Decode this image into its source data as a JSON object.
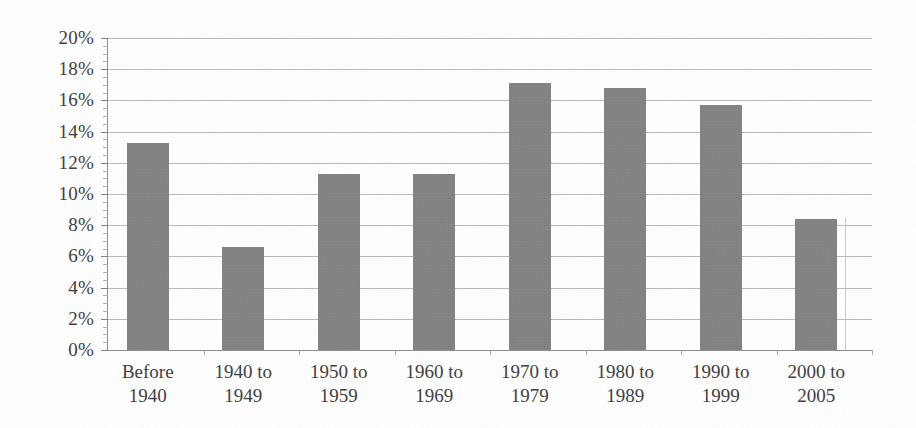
{
  "chart_data": {
    "type": "bar",
    "title": "",
    "subtitle": "",
    "xlabel": "",
    "ylabel": "",
    "categories": [
      "Before 1940",
      "1940 to 1949",
      "1950 to 1959",
      "1960 to 1969",
      "1970 to 1979",
      "1980 to 1989",
      "1990 to 1999",
      "2000 to 2005"
    ],
    "category_lines": [
      [
        "Before",
        "1940"
      ],
      [
        "1940 to",
        "1949"
      ],
      [
        "1950 to",
        "1959"
      ],
      [
        "1960 to",
        "1969"
      ],
      [
        "1970 to",
        "1979"
      ],
      [
        "1980 to",
        "1989"
      ],
      [
        "1990 to",
        "1999"
      ],
      [
        "2000 to",
        "2005"
      ]
    ],
    "values": [
      13.3,
      6.6,
      11.3,
      11.3,
      17.1,
      16.8,
      15.7,
      8.4
    ],
    "value_labels": [
      "13.3%",
      "6.6%",
      "11.3%",
      "11.3%",
      "17.1%",
      "16.8%",
      "15.7%",
      "8.4%"
    ],
    "ylim": [
      0,
      20
    ],
    "ytick_values": [
      0,
      2,
      4,
      6,
      8,
      10,
      12,
      14,
      16,
      18,
      20
    ],
    "ytick_labels": [
      "0%",
      "2%",
      "4%",
      "6%",
      "8%",
      "10%",
      "12%",
      "14%",
      "16%",
      "18%",
      "20%"
    ],
    "y_minor_tick_step": 0.5,
    "grid": "horizontal",
    "legend": "none",
    "series": [
      {
        "name": "Share of units",
        "values": [
          13.3,
          6.6,
          11.3,
          11.3,
          17.1,
          16.8,
          15.7,
          8.4
        ]
      }
    ],
    "colors": {
      "bar_fill": "#7e7e7e",
      "gridline": "#b9b9b9",
      "axis": "#8d8d8d",
      "text": "#3c3c3c",
      "background": "#ffffff"
    }
  }
}
